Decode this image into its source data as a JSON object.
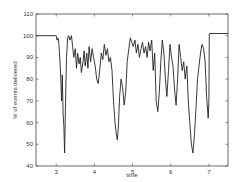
{
  "chart_data": {
    "type": "line",
    "title": "",
    "xlabel": "time",
    "ylabel": "% of events delivered",
    "xlim": [
      2.47,
      7.5
    ],
    "ylim": [
      40,
      110
    ],
    "xticks": [
      3,
      4,
      5,
      6,
      7
    ],
    "yticks": [
      40,
      50,
      60,
      70,
      80,
      90,
      100,
      110
    ],
    "grid": false,
    "legend": null,
    "series": [
      {
        "name": "% of events delivered",
        "color": "#222222",
        "x": [
          2.47,
          3.0,
          3.02,
          3.05,
          3.07,
          3.1,
          3.12,
          3.14,
          3.16,
          3.18,
          3.2,
          3.22,
          3.24,
          3.27,
          3.3,
          3.33,
          3.36,
          3.4,
          3.43,
          3.46,
          3.5,
          3.53,
          3.56,
          3.6,
          3.63,
          3.66,
          3.7,
          3.73,
          3.76,
          3.8,
          3.83,
          3.86,
          3.9,
          3.94,
          3.98,
          4.02,
          4.06,
          4.1,
          4.14,
          4.18,
          4.22,
          4.26,
          4.3,
          4.34,
          4.38,
          4.42,
          4.46,
          4.5,
          4.54,
          4.57,
          4.6,
          4.63,
          4.66,
          4.7,
          4.74,
          4.78,
          4.82,
          4.86,
          4.9,
          4.94,
          4.98,
          5.02,
          5.06,
          5.1,
          5.14,
          5.18,
          5.22,
          5.26,
          5.3,
          5.34,
          5.38,
          5.42,
          5.46,
          5.5,
          5.54,
          5.58,
          5.62,
          5.66,
          5.7,
          5.74,
          5.78,
          5.82,
          5.86,
          5.9,
          5.94,
          5.98,
          6.02,
          6.06,
          6.1,
          6.14,
          6.18,
          6.22,
          6.26,
          6.3,
          6.34,
          6.38,
          6.42,
          6.46,
          6.5,
          6.54,
          6.58,
          6.62,
          6.66,
          6.7,
          6.74,
          6.78,
          6.82,
          6.86,
          6.9,
          6.94,
          6.98,
          7.0,
          7.01,
          7.5
        ],
        "y": [
          100,
          100,
          98,
          99,
          96,
          88,
          80,
          70,
          82,
          64,
          58,
          46,
          66,
          90,
          99,
          100,
          98,
          100,
          95,
          90,
          94,
          85,
          92,
          87,
          90,
          83,
          88,
          93,
          86,
          92,
          85,
          95,
          88,
          94,
          90,
          86,
          80,
          78,
          84,
          92,
          89,
          96,
          91,
          94,
          88,
          90,
          84,
          70,
          60,
          55,
          52,
          58,
          72,
          80,
          76,
          68,
          74,
          88,
          94,
          99,
          97,
          95,
          98,
          92,
          96,
          90,
          94,
          97,
          92,
          95,
          90,
          97,
          93,
          98,
          84,
          92,
          70,
          65,
          74,
          88,
          98,
          92,
          80,
          72,
          84,
          96,
          90,
          86,
          75,
          68,
          80,
          96,
          90,
          84,
          88,
          80,
          86,
          70,
          60,
          50,
          46,
          54,
          66,
          80,
          86,
          92,
          96,
          94,
          88,
          72,
          62,
          70,
          101,
          101
        ]
      }
    ]
  }
}
